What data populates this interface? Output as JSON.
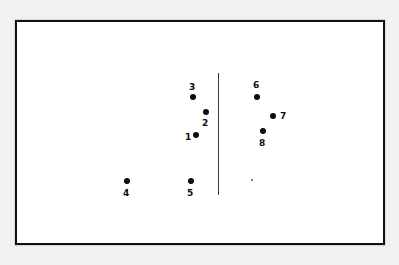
{
  "figure": {
    "background_color": "#f1f1f1",
    "panel_color": "#ffffff",
    "frame_color": "#111111",
    "ink_color": "#0d0d0d"
  },
  "divider": {
    "name": "vertical-divider-line",
    "x": 218,
    "y_top": 73,
    "y_bottom": 195,
    "thickness": 1,
    "color": "#3a3a3a"
  },
  "chart_data": {
    "type": "scatter",
    "title": "",
    "subtitle": "",
    "xlabel": "",
    "ylabel": "",
    "grid": false,
    "legend": null,
    "axis_ticks": [],
    "annotations": [
      {
        "name": "vertical-divider-line",
        "kind": "vline",
        "x": 218,
        "y_top": 73,
        "y_bottom": 195
      }
    ],
    "xlim": [
      15,
      385
    ],
    "ylim": [
      245,
      20
    ],
    "marker_color": "#0d0d0d",
    "marker_radius": 3,
    "groups": [
      {
        "name": "left-cluster",
        "labels": [
          "1",
          "2",
          "3",
          "4",
          "5"
        ]
      },
      {
        "name": "right-cluster",
        "labels": [
          "6",
          "7",
          "8"
        ]
      }
    ],
    "points": [
      {
        "label": "1",
        "x": 196,
        "y": 135,
        "r": 3,
        "label_x": 185,
        "label_y": 133,
        "label_position": "left"
      },
      {
        "label": "2",
        "x": 206,
        "y": 112,
        "r": 3,
        "label_x": 202,
        "label_y": 119,
        "label_position": "below"
      },
      {
        "label": "3",
        "x": 193,
        "y": 97,
        "r": 3,
        "label_x": 189,
        "label_y": 83,
        "label_position": "above"
      },
      {
        "label": "4",
        "x": 127,
        "y": 181,
        "r": 3,
        "label_x": 123,
        "label_y": 189,
        "label_position": "below"
      },
      {
        "label": "5",
        "x": 191,
        "y": 181,
        "r": 3,
        "label_x": 187,
        "label_y": 189,
        "label_position": "below"
      },
      {
        "label": "6",
        "x": 257,
        "y": 97,
        "r": 3,
        "label_x": 253,
        "label_y": 81,
        "label_position": "above"
      },
      {
        "label": "7",
        "x": 273,
        "y": 116,
        "r": 3,
        "label_x": 280,
        "label_y": 112,
        "label_position": "right"
      },
      {
        "label": "8",
        "x": 263,
        "y": 131,
        "r": 3,
        "label_x": 259,
        "label_y": 139,
        "label_position": "below"
      }
    ],
    "unlabeled_marks": [
      {
        "name": "stray-speck",
        "x": 252,
        "y": 180,
        "r": 1.2,
        "color": "#5a5a5a"
      }
    ]
  }
}
